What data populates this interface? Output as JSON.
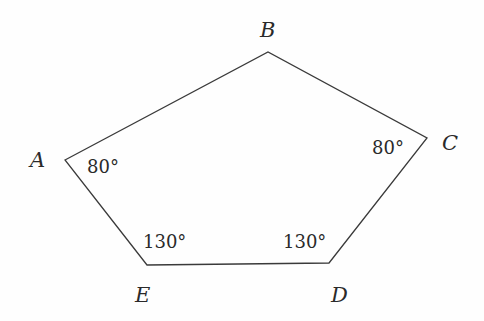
{
  "diagram": {
    "type": "pentagon",
    "stroke_color": "#3a3a3a",
    "vertices": [
      {
        "name": "A",
        "x": 65,
        "y": 160
      },
      {
        "name": "B",
        "x": 268,
        "y": 52
      },
      {
        "name": "C",
        "x": 427,
        "y": 138
      },
      {
        "name": "D",
        "x": 329,
        "y": 263
      },
      {
        "name": "E",
        "x": 147,
        "y": 265
      }
    ],
    "labels": {
      "A": "A",
      "B": "B",
      "C": "C",
      "D": "D",
      "E": "E"
    },
    "angles": {
      "A": "80°",
      "C": "80°",
      "D": "130°",
      "E": "130°"
    }
  }
}
